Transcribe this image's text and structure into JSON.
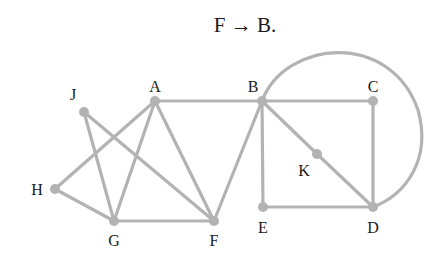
{
  "title": "F → B.",
  "graph": {
    "edge_color": "#b3b3b3",
    "label_color": "#1a1a1a",
    "nodes": [
      {
        "id": "A",
        "label": "A",
        "x": 155,
        "y": 101,
        "lx": 155,
        "ly": 92
      },
      {
        "id": "B",
        "label": "B",
        "x": 262,
        "y": 101,
        "lx": 253,
        "ly": 92
      },
      {
        "id": "C",
        "label": "C",
        "x": 373,
        "y": 101,
        "lx": 373,
        "ly": 92
      },
      {
        "id": "J",
        "label": "J",
        "x": 84,
        "y": 112,
        "lx": 73,
        "ly": 100
      },
      {
        "id": "H",
        "label": "H",
        "x": 55,
        "y": 189,
        "lx": 37,
        "ly": 195
      },
      {
        "id": "G",
        "label": "G",
        "x": 114,
        "y": 221,
        "lx": 114,
        "ly": 246
      },
      {
        "id": "F",
        "label": "F",
        "x": 214,
        "y": 221,
        "lx": 214,
        "ly": 246
      },
      {
        "id": "E",
        "label": "E",
        "x": 263,
        "y": 207,
        "lx": 263,
        "ly": 233
      },
      {
        "id": "D",
        "label": "D",
        "x": 373,
        "y": 207,
        "lx": 373,
        "ly": 233
      },
      {
        "id": "K",
        "label": "K",
        "x": 317,
        "y": 154,
        "lx": 304,
        "ly": 176
      }
    ],
    "edges": [
      [
        "J",
        "G"
      ],
      [
        "J",
        "F"
      ],
      [
        "A",
        "H"
      ],
      [
        "A",
        "G"
      ],
      [
        "A",
        "F"
      ],
      [
        "H",
        "G"
      ],
      [
        "G",
        "F"
      ],
      [
        "A",
        "B"
      ],
      [
        "F",
        "B"
      ],
      [
        "B",
        "C"
      ],
      [
        "B",
        "E"
      ],
      [
        "B",
        "K"
      ],
      [
        "K",
        "D"
      ],
      [
        "C",
        "D"
      ],
      [
        "E",
        "D"
      ]
    ],
    "arcs": [
      {
        "from": "B",
        "to": "D",
        "path": "M262,101 C285,40 390,30 418,110 C432,160 405,195 373,207"
      }
    ]
  }
}
